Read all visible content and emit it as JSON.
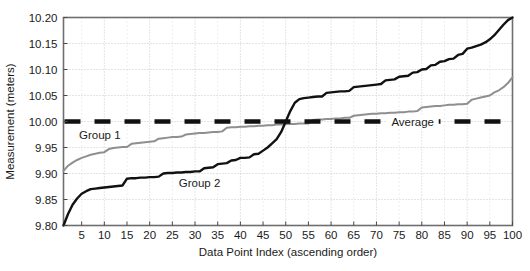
{
  "chart_data": {
    "type": "line",
    "title": "",
    "xlabel": "Data Point Index (ascending order)",
    "ylabel": "Measurement (meters)",
    "xlim": [
      1,
      100
    ],
    "ylim": [
      9.8,
      10.2
    ],
    "xticks": [
      5,
      10,
      15,
      20,
      25,
      30,
      35,
      40,
      45,
      50,
      55,
      60,
      65,
      70,
      75,
      80,
      85,
      90,
      95,
      100
    ],
    "yticks": [
      9.8,
      9.85,
      9.9,
      9.95,
      10.0,
      10.05,
      10.1,
      10.15,
      10.2
    ],
    "ytick_labels": [
      "9.80",
      "9.85",
      "9.90",
      "9.95",
      "10.00",
      "10.05",
      "10.10",
      "10.15",
      "10.20"
    ],
    "grid": true,
    "grid_style": "dotted",
    "legend": "inline-annotations",
    "annotations": [
      {
        "text": "Group 1",
        "x": 9,
        "y": 9.975
      },
      {
        "text": "Group 2",
        "x": 31,
        "y": 9.882
      },
      {
        "text": "Average",
        "x": 78,
        "y": 10.0
      }
    ],
    "series": [
      {
        "name": "Group 1",
        "color": "#8f8f8f",
        "width": 2,
        "style": "solid",
        "x": [
          1,
          2,
          3,
          4,
          5,
          6,
          7,
          8,
          9,
          10,
          11,
          12,
          13,
          14,
          15,
          16,
          17,
          18,
          19,
          20,
          21,
          22,
          23,
          24,
          25,
          26,
          27,
          28,
          29,
          30,
          31,
          32,
          33,
          34,
          35,
          36,
          37,
          38,
          39,
          40,
          41,
          42,
          43,
          44,
          45,
          46,
          47,
          48,
          49,
          50,
          51,
          52,
          53,
          54,
          55,
          56,
          57,
          58,
          59,
          60,
          61,
          62,
          63,
          64,
          65,
          66,
          67,
          68,
          69,
          70,
          71,
          72,
          73,
          74,
          75,
          76,
          77,
          78,
          79,
          80,
          81,
          82,
          83,
          84,
          85,
          86,
          87,
          88,
          89,
          90,
          91,
          92,
          93,
          94,
          95,
          96,
          97,
          98,
          99,
          100
        ],
        "values": [
          9.905,
          9.915,
          9.921,
          9.926,
          9.93,
          9.933,
          9.936,
          9.938,
          9.94,
          9.941,
          9.947,
          9.949,
          9.95,
          9.951,
          9.951,
          9.957,
          9.958,
          9.959,
          9.96,
          9.961,
          9.962,
          9.967,
          9.968,
          9.969,
          9.97,
          9.97,
          9.971,
          9.975,
          9.976,
          9.977,
          9.978,
          9.978,
          9.979,
          9.98,
          9.98,
          9.981,
          9.988,
          9.989,
          9.989,
          9.99,
          9.99,
          9.991,
          9.991,
          9.992,
          9.992,
          9.993,
          9.993,
          9.994,
          9.994,
          9.995,
          9.995,
          9.995,
          9.996,
          9.996,
          9.996,
          10.003,
          10.004,
          10.004,
          10.005,
          10.005,
          10.006,
          10.006,
          10.007,
          10.007,
          10.011,
          10.012,
          10.013,
          10.014,
          10.015,
          10.015,
          10.016,
          10.016,
          10.017,
          10.017,
          10.018,
          10.018,
          10.019,
          10.019,
          10.02,
          10.027,
          10.028,
          10.029,
          10.03,
          10.03,
          10.031,
          10.032,
          10.032,
          10.033,
          10.033,
          10.034,
          10.042,
          10.044,
          10.046,
          10.048,
          10.05,
          10.056,
          10.06,
          10.066,
          10.074,
          10.085
        ]
      },
      {
        "name": "Group 2",
        "color": "#111111",
        "width": 2.4,
        "style": "solid",
        "x": [
          1,
          2,
          3,
          4,
          5,
          6,
          7,
          8,
          9,
          10,
          11,
          12,
          13,
          14,
          15,
          16,
          17,
          18,
          19,
          20,
          21,
          22,
          23,
          24,
          25,
          26,
          27,
          28,
          29,
          30,
          31,
          32,
          33,
          34,
          35,
          36,
          37,
          38,
          39,
          40,
          41,
          42,
          43,
          44,
          45,
          46,
          47,
          48,
          49,
          50,
          51,
          52,
          53,
          54,
          55,
          56,
          57,
          58,
          59,
          60,
          61,
          62,
          63,
          64,
          65,
          66,
          67,
          68,
          69,
          70,
          71,
          72,
          73,
          74,
          75,
          76,
          77,
          78,
          79,
          80,
          81,
          82,
          83,
          84,
          85,
          86,
          87,
          88,
          89,
          90,
          91,
          92,
          93,
          94,
          95,
          96,
          97,
          98,
          99,
          100
        ],
        "values": [
          9.8,
          9.822,
          9.84,
          9.852,
          9.861,
          9.866,
          9.87,
          9.871,
          9.872,
          9.873,
          9.874,
          9.875,
          9.876,
          9.877,
          9.89,
          9.891,
          9.891,
          9.892,
          9.892,
          9.893,
          9.893,
          9.894,
          9.9,
          9.901,
          9.901,
          9.902,
          9.902,
          9.903,
          9.903,
          9.904,
          9.904,
          9.91,
          9.911,
          9.912,
          9.918,
          9.919,
          9.92,
          9.925,
          9.926,
          9.93,
          9.93,
          9.931,
          9.937,
          9.938,
          9.944,
          9.95,
          9.958,
          9.966,
          9.98,
          10.0,
          10.02,
          10.036,
          10.043,
          10.045,
          10.046,
          10.047,
          10.048,
          10.048,
          10.055,
          10.056,
          10.057,
          10.058,
          10.058,
          10.059,
          10.066,
          10.067,
          10.068,
          10.069,
          10.07,
          10.071,
          10.072,
          10.079,
          10.08,
          10.081,
          10.086,
          10.087,
          10.088,
          10.094,
          10.095,
          10.1,
          10.101,
          10.108,
          10.109,
          10.115,
          10.116,
          10.12,
          10.121,
          10.128,
          10.13,
          10.14,
          10.142,
          10.145,
          10.148,
          10.152,
          10.158,
          10.166,
          10.176,
          10.186,
          10.195,
          10.2
        ]
      },
      {
        "name": "Average",
        "color": "#111111",
        "width": 4.5,
        "style": "dashed",
        "constant_y": 10.0
      }
    ]
  },
  "caption": {
    "line1": "Data Point Index (ascending order)"
  }
}
